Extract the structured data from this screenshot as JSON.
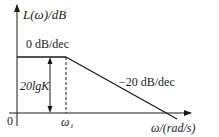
{
  "diagram": {
    "y_axis_label": "L(ω)/dB",
    "x_axis_label": "ω/(rad/s)",
    "origin_label": "0",
    "corner_frequency_label": "ω₁",
    "gain_label": "20lgK",
    "segments": [
      {
        "name": "low-frequency",
        "slope_label": "0 dB/dec"
      },
      {
        "name": "high-frequency",
        "slope_label": "−20 dB/dec"
      }
    ],
    "colors": {
      "line": "#1a1a1a",
      "background": "#ffffff"
    }
  }
}
